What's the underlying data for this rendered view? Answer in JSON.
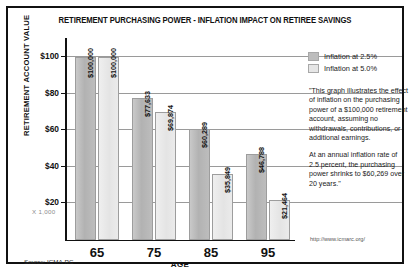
{
  "title": "RETIREMENT PURCHASING POWER - INFLATION IMPACT ON RETIREE SAVINGS",
  "y_units_note": "X 1,000",
  "source_note": "Source: ICMA-RC",
  "source_url": "http://www.icmarc.org/",
  "annotation": {
    "paragraph1": "\"This graph illustrates the effect of inflation on the purchasing power of a $100,000 retirement account, assuming no withdrawals, contributions, or additional earnings.",
    "paragraph2": "At an annual inflation rate of 2.5 percent, the purchasing power shrinks to $60,269 over 20 years.\""
  },
  "colors": {
    "series_1": "#bdbdbd",
    "series_2": "#e6e6e6",
    "axis": "#111111",
    "grid": "#9a9a9a"
  },
  "chart_data": {
    "type": "bar",
    "title": "RETIREMENT PURCHASING POWER - INFLATION IMPACT ON RETIREE SAVINGS",
    "xlabel": "AGE",
    "ylabel": "RETIREMENT ACCOUNT VALUE",
    "categories": [
      "65",
      "75",
      "85",
      "95"
    ],
    "ylim": [
      0,
      110
    ],
    "yticks": [
      20,
      40,
      60,
      80,
      100
    ],
    "ytick_labels": [
      "$20",
      "$40",
      "$60",
      "$80",
      "$100"
    ],
    "y_scale_note": "X 1,000",
    "grid": true,
    "legend_position": "right",
    "series": [
      {
        "name": "Inflation at 2.5%",
        "color": "#bdbdbd",
        "values": [
          100000,
          77633,
          60289,
          46788
        ],
        "labels": [
          "$100,000",
          "$77,633",
          "$60,289",
          "$46,788"
        ]
      },
      {
        "name": "Inflation at 5.0%",
        "color": "#e6e6e6",
        "values": [
          100000,
          69874,
          35849,
          21464
        ],
        "labels": [
          "$100,000",
          "$69,874",
          "$35,849",
          "$21,464"
        ]
      }
    ]
  }
}
